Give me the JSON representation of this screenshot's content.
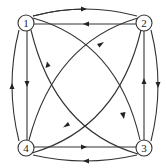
{
  "diagram": {
    "type": "directed-graph",
    "colors": {
      "stroke": "#333333",
      "background": "#ffffff"
    },
    "nodes": [
      {
        "id": "1",
        "label": "1",
        "x": 26,
        "y": 23
      },
      {
        "id": "2",
        "label": "2",
        "x": 144,
        "y": 23
      },
      {
        "id": "3",
        "label": "3",
        "x": 144,
        "y": 148
      },
      {
        "id": "4",
        "label": "4",
        "x": 26,
        "y": 148
      }
    ],
    "edges": [
      {
        "from": "1",
        "to": "2",
        "shape": "curved-outer"
      },
      {
        "from": "2",
        "to": "1",
        "shape": "straight"
      },
      {
        "from": "2",
        "to": "3",
        "shape": "curved-outer"
      },
      {
        "from": "3",
        "to": "2",
        "shape": "straight"
      },
      {
        "from": "4",
        "to": "3",
        "shape": "straight"
      },
      {
        "from": "3",
        "to": "4",
        "shape": "curved-outer"
      },
      {
        "from": "1",
        "to": "4",
        "shape": "straight"
      },
      {
        "from": "4",
        "to": "1",
        "shape": "curved-outer"
      },
      {
        "from": "1",
        "to": "3",
        "shape": "curved-diagonal"
      },
      {
        "from": "3",
        "to": "1",
        "shape": "curved-diagonal"
      },
      {
        "from": "4",
        "to": "2",
        "shape": "curved-diagonal"
      },
      {
        "from": "2",
        "to": "4",
        "shape": "curved-diagonal"
      }
    ]
  }
}
